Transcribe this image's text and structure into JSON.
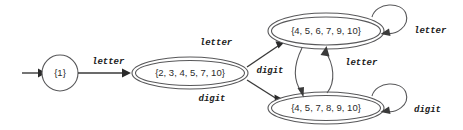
{
  "diagram": {
    "type": "finite-automaton-state-diagram",
    "states": [
      {
        "id": "start-state",
        "label": "{1}",
        "shape": "circle",
        "accepting": false,
        "cx": 60,
        "cy": 73,
        "r": 18
      },
      {
        "id": "state-2345710",
        "label": "{2, 3, 4, 5, 7, 10}",
        "shape": "double-ellipse",
        "accepting": true,
        "cx": 190,
        "cy": 73,
        "rx": 58,
        "ry": 16
      },
      {
        "id": "state-4567910",
        "label": "{4, 5, 6, 7, 9, 10}",
        "shape": "double-ellipse",
        "accepting": true,
        "cx": 326,
        "cy": 31,
        "rx": 58,
        "ry": 18
      },
      {
        "id": "state-4578910",
        "label": "{4, 5, 7, 8, 9, 10}",
        "shape": "double-ellipse",
        "accepting": true,
        "cx": 326,
        "cy": 108,
        "rx": 58,
        "ry": 16
      }
    ],
    "start_arrow": {
      "label": ""
    },
    "transitions": [
      {
        "id": "t-start-letter",
        "from": "start-state",
        "to": "state-2345710",
        "label": "letter",
        "label_x": 92,
        "label_y": 62
      },
      {
        "id": "t-letter-up",
        "from": "state-2345710",
        "to": "state-4567910",
        "label": "letter",
        "label_x": 216,
        "label_y": 43
      },
      {
        "id": "t-digit-down",
        "from": "state-2345710",
        "to": "state-4578910",
        "label": "digit",
        "label_x": 212,
        "label_y": 99
      },
      {
        "id": "t-digit-cross",
        "from": "state-4567910",
        "to": "state-4578910",
        "label": "digit",
        "label_x": 270,
        "label_y": 71
      },
      {
        "id": "t-letter-cross",
        "from": "state-4578910",
        "to": "state-4567910",
        "label": "letter",
        "label_x": 345,
        "label_y": 63
      },
      {
        "id": "t-letter-loop",
        "from": "state-4567910",
        "to": "state-4567910",
        "label": "letter",
        "label_x": 414,
        "label_y": 31
      },
      {
        "id": "t-digit-loop",
        "from": "state-4578910",
        "to": "state-4578910",
        "label": "digit",
        "label_x": 414,
        "label_y": 110
      }
    ],
    "colors": {
      "background": "#ffffff",
      "state_stroke": "#58585a",
      "edge_stroke": "#3a3a3a",
      "text": "#1a1a1a"
    }
  }
}
